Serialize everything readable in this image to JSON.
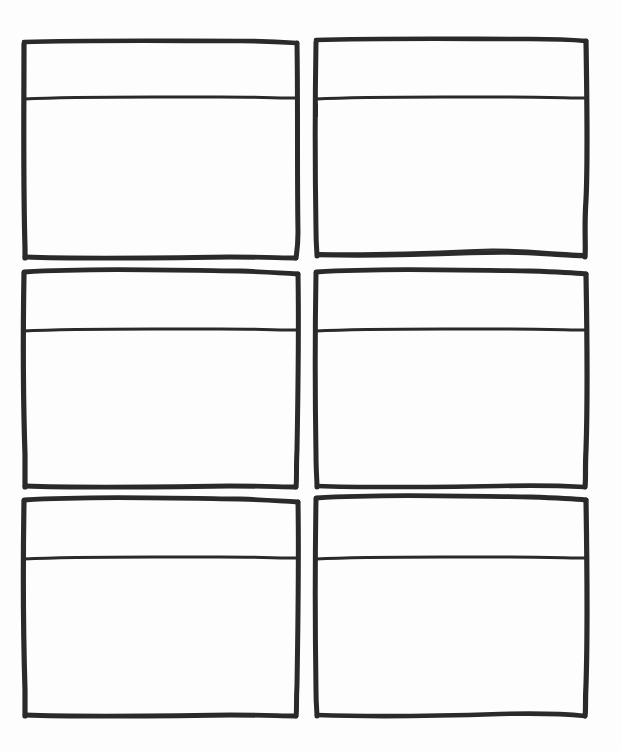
{
  "document": {
    "title": "Blank Storyboard Template",
    "medium": "hand-drawn ink on paper",
    "page_width": 621,
    "page_height": 751,
    "background_color": "#fdfdfd",
    "ink_color": "#2a2a2a",
    "grid": {
      "columns": 2,
      "rows": 3,
      "panel_count": 6
    }
  },
  "panels": [
    {
      "id": "panel-1",
      "label": "Panel 1",
      "row": 1,
      "column": 1,
      "header_text": "",
      "body_text": "",
      "frame": {
        "x": 23,
        "y": 41,
        "width": 275,
        "height": 218
      },
      "divider_y": 98
    },
    {
      "id": "panel-2",
      "label": "Panel 2",
      "row": 1,
      "column": 2,
      "header_text": "",
      "body_text": "",
      "frame": {
        "x": 315,
        "y": 39,
        "width": 272,
        "height": 218
      },
      "divider_y": 98
    },
    {
      "id": "panel-3",
      "label": "Panel 3",
      "row": 2,
      "column": 1,
      "header_text": "",
      "body_text": "",
      "frame": {
        "x": 23,
        "y": 270,
        "width": 275,
        "height": 217
      },
      "divider_y": 330
    },
    {
      "id": "panel-4",
      "label": "Panel 4",
      "row": 2,
      "column": 2,
      "header_text": "",
      "body_text": "",
      "frame": {
        "x": 315,
        "y": 270,
        "width": 272,
        "height": 217
      },
      "divider_y": 330
    },
    {
      "id": "panel-5",
      "label": "Panel 5",
      "row": 3,
      "column": 1,
      "header_text": "",
      "body_text": "",
      "frame": {
        "x": 23,
        "y": 498,
        "width": 275,
        "height": 219
      },
      "divider_y": 558
    },
    {
      "id": "panel-6",
      "label": "Panel 6",
      "row": 3,
      "column": 2,
      "header_text": "",
      "body_text": "",
      "frame": {
        "x": 315,
        "y": 496,
        "width": 272,
        "height": 221
      },
      "divider_y": 558
    }
  ]
}
